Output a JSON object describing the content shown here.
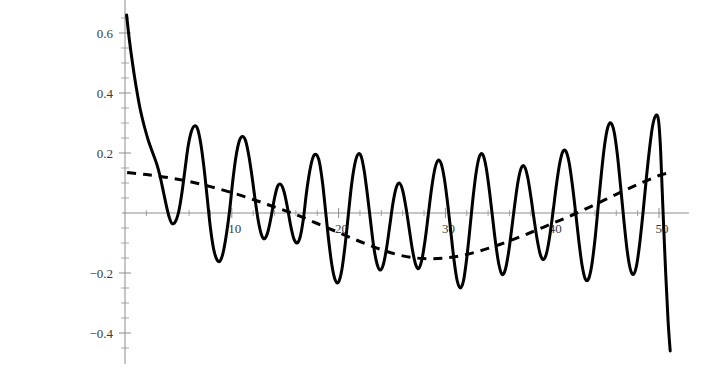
{
  "cell": {
    "out_label": "Out[4]="
  },
  "chart_data": {
    "type": "line",
    "title": "",
    "xlabel": "",
    "ylabel": "",
    "xlim": [
      0,
      51.5
    ],
    "ylim": [
      -0.47,
      0.68
    ],
    "grid": false,
    "legend": null,
    "background": "#ffffff",
    "axes": {
      "x_axis_at_y": 0,
      "y_axis_at_x": 0,
      "x_ticks_major": [
        10,
        20,
        30,
        40,
        50
      ],
      "x_tick_labels": [
        "10",
        "20",
        "30",
        "40",
        "50"
      ],
      "x_ticks_minor_step": 2,
      "y_ticks_major": [
        -0.4,
        -0.2,
        0.2,
        0.4,
        0.6
      ],
      "y_tick_labels": [
        "-0.4",
        "-0.2",
        "0.2",
        "0.4",
        "0.6"
      ],
      "y_ticks_minor_step": 0.05,
      "axis_color": "#8d8d8d",
      "tick_label_color": "#3a3a3a"
    },
    "series": [
      {
        "name": "oscillatory-signal",
        "style": "solid",
        "color": "#000000",
        "width": 3,
        "points": [
          [
            0.15,
            0.66
          ],
          [
            0.4,
            0.58
          ],
          [
            0.7,
            0.5
          ],
          [
            1.0,
            0.43
          ],
          [
            1.4,
            0.35
          ],
          [
            1.8,
            0.29
          ],
          [
            2.2,
            0.24
          ],
          [
            2.6,
            0.2
          ],
          [
            3.0,
            0.16
          ],
          [
            3.3,
            0.12
          ],
          [
            3.6,
            0.07
          ],
          [
            3.9,
            0.02
          ],
          [
            4.15,
            -0.015
          ],
          [
            4.4,
            -0.035
          ],
          [
            4.7,
            -0.03
          ],
          [
            5.0,
            0.0
          ],
          [
            5.3,
            0.06
          ],
          [
            5.6,
            0.14
          ],
          [
            5.9,
            0.22
          ],
          [
            6.2,
            0.27
          ],
          [
            6.5,
            0.29
          ],
          [
            6.8,
            0.28
          ],
          [
            7.1,
            0.23
          ],
          [
            7.4,
            0.15
          ],
          [
            7.7,
            0.05
          ],
          [
            8.0,
            -0.05
          ],
          [
            8.3,
            -0.12
          ],
          [
            8.6,
            -0.155
          ],
          [
            8.9,
            -0.16
          ],
          [
            9.2,
            -0.13
          ],
          [
            9.5,
            -0.07
          ],
          [
            9.8,
            0.01
          ],
          [
            10.1,
            0.11
          ],
          [
            10.4,
            0.19
          ],
          [
            10.7,
            0.24
          ],
          [
            11.0,
            0.255
          ],
          [
            11.3,
            0.24
          ],
          [
            11.6,
            0.19
          ],
          [
            11.9,
            0.12
          ],
          [
            12.2,
            0.04
          ],
          [
            12.5,
            -0.03
          ],
          [
            12.8,
            -0.075
          ],
          [
            13.1,
            -0.085
          ],
          [
            13.4,
            -0.06
          ],
          [
            13.7,
            -0.01
          ],
          [
            14.0,
            0.05
          ],
          [
            14.3,
            0.09
          ],
          [
            14.6,
            0.095
          ],
          [
            14.9,
            0.07
          ],
          [
            15.2,
            0.02
          ],
          [
            15.5,
            -0.04
          ],
          [
            15.8,
            -0.085
          ],
          [
            16.1,
            -0.1
          ],
          [
            16.4,
            -0.08
          ],
          [
            16.7,
            -0.02
          ],
          [
            17.0,
            0.07
          ],
          [
            17.3,
            0.14
          ],
          [
            17.6,
            0.185
          ],
          [
            17.9,
            0.195
          ],
          [
            18.2,
            0.17
          ],
          [
            18.5,
            0.1
          ],
          [
            18.8,
            0.0
          ],
          [
            19.1,
            -0.1
          ],
          [
            19.4,
            -0.18
          ],
          [
            19.7,
            -0.225
          ],
          [
            20.0,
            -0.23
          ],
          [
            20.3,
            -0.19
          ],
          [
            20.6,
            -0.11
          ],
          [
            20.9,
            -0.01
          ],
          [
            21.2,
            0.09
          ],
          [
            21.5,
            0.16
          ],
          [
            21.8,
            0.195
          ],
          [
            22.1,
            0.19
          ],
          [
            22.4,
            0.14
          ],
          [
            22.7,
            0.06
          ],
          [
            23.0,
            -0.03
          ],
          [
            23.3,
            -0.115
          ],
          [
            23.6,
            -0.17
          ],
          [
            23.9,
            -0.19
          ],
          [
            24.2,
            -0.17
          ],
          [
            24.5,
            -0.115
          ],
          [
            24.8,
            -0.04
          ],
          [
            25.1,
            0.035
          ],
          [
            25.4,
            0.085
          ],
          [
            25.7,
            0.1
          ],
          [
            26.0,
            0.075
          ],
          [
            26.3,
            0.02
          ],
          [
            26.6,
            -0.05
          ],
          [
            26.9,
            -0.12
          ],
          [
            27.2,
            -0.17
          ],
          [
            27.5,
            -0.185
          ],
          [
            27.8,
            -0.155
          ],
          [
            28.1,
            -0.09
          ],
          [
            28.4,
            -0.005
          ],
          [
            28.7,
            0.08
          ],
          [
            29.0,
            0.145
          ],
          [
            29.3,
            0.175
          ],
          [
            29.6,
            0.165
          ],
          [
            29.9,
            0.115
          ],
          [
            30.2,
            0.035
          ],
          [
            30.5,
            -0.06
          ],
          [
            30.8,
            -0.155
          ],
          [
            31.1,
            -0.225
          ],
          [
            31.4,
            -0.25
          ],
          [
            31.7,
            -0.225
          ],
          [
            32.0,
            -0.15
          ],
          [
            32.3,
            -0.05
          ],
          [
            32.6,
            0.055
          ],
          [
            32.9,
            0.14
          ],
          [
            33.2,
            0.19
          ],
          [
            33.5,
            0.195
          ],
          [
            33.8,
            0.155
          ],
          [
            34.1,
            0.08
          ],
          [
            34.4,
            -0.01
          ],
          [
            34.7,
            -0.1
          ],
          [
            35.0,
            -0.17
          ],
          [
            35.3,
            -0.205
          ],
          [
            35.6,
            -0.19
          ],
          [
            35.9,
            -0.135
          ],
          [
            36.2,
            -0.055
          ],
          [
            36.5,
            0.03
          ],
          [
            36.8,
            0.105
          ],
          [
            37.1,
            0.15
          ],
          [
            37.4,
            0.155
          ],
          [
            37.7,
            0.12
          ],
          [
            38.0,
            0.055
          ],
          [
            38.3,
            -0.02
          ],
          [
            38.6,
            -0.09
          ],
          [
            38.9,
            -0.14
          ],
          [
            39.2,
            -0.155
          ],
          [
            39.5,
            -0.13
          ],
          [
            39.8,
            -0.07
          ],
          [
            40.1,
            0.01
          ],
          [
            40.4,
            0.095
          ],
          [
            40.7,
            0.165
          ],
          [
            41.0,
            0.205
          ],
          [
            41.3,
            0.205
          ],
          [
            41.6,
            0.165
          ],
          [
            41.9,
            0.09
          ],
          [
            42.2,
            0.0
          ],
          [
            42.5,
            -0.095
          ],
          [
            42.8,
            -0.175
          ],
          [
            43.1,
            -0.22
          ],
          [
            43.4,
            -0.22
          ],
          [
            43.7,
            -0.175
          ],
          [
            44.0,
            -0.09
          ],
          [
            44.3,
            0.02
          ],
          [
            44.6,
            0.13
          ],
          [
            44.9,
            0.225
          ],
          [
            45.2,
            0.285
          ],
          [
            45.5,
            0.3
          ],
          [
            45.8,
            0.27
          ],
          [
            46.1,
            0.195
          ],
          [
            46.4,
            0.09
          ],
          [
            46.7,
            -0.02
          ],
          [
            47.0,
            -0.12
          ],
          [
            47.3,
            -0.185
          ],
          [
            47.6,
            -0.205
          ],
          [
            47.9,
            -0.175
          ],
          [
            48.2,
            -0.1
          ],
          [
            48.5,
            0.0
          ],
          [
            48.8,
            0.11
          ],
          [
            49.1,
            0.21
          ],
          [
            49.4,
            0.29
          ],
          [
            49.7,
            0.325
          ],
          [
            49.95,
            0.31
          ],
          [
            50.15,
            0.21
          ],
          [
            50.35,
            0.03
          ],
          [
            50.6,
            -0.18
          ],
          [
            50.85,
            -0.36
          ],
          [
            51.05,
            -0.46
          ]
        ]
      },
      {
        "name": "trend-envelope",
        "style": "dashed",
        "color": "#000000",
        "width": 3,
        "dash": "9 7",
        "points": [
          [
            0.2,
            0.135
          ],
          [
            2.0,
            0.128
          ],
          [
            4.0,
            0.118
          ],
          [
            6.0,
            0.105
          ],
          [
            8.0,
            0.088
          ],
          [
            10.0,
            0.068
          ],
          [
            12.0,
            0.045
          ],
          [
            14.0,
            0.02
          ],
          [
            16.0,
            -0.005
          ],
          [
            18.0,
            -0.035
          ],
          [
            20.0,
            -0.065
          ],
          [
            22.0,
            -0.095
          ],
          [
            24.0,
            -0.122
          ],
          [
            26.0,
            -0.143
          ],
          [
            28.0,
            -0.152
          ],
          [
            30.0,
            -0.15
          ],
          [
            32.0,
            -0.138
          ],
          [
            34.0,
            -0.118
          ],
          [
            36.0,
            -0.093
          ],
          [
            38.0,
            -0.065
          ],
          [
            40.0,
            -0.035
          ],
          [
            42.0,
            -0.005
          ],
          [
            44.0,
            0.028
          ],
          [
            46.0,
            0.062
          ],
          [
            48.0,
            0.095
          ],
          [
            50.0,
            0.125
          ],
          [
            50.8,
            0.133
          ]
        ]
      }
    ]
  }
}
